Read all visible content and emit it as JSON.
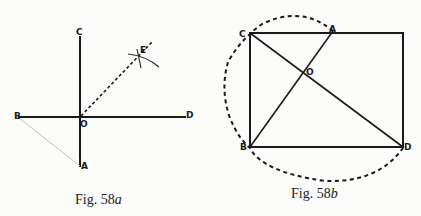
{
  "figures": [
    {
      "id": "58a",
      "caption": "Fig. 58a",
      "caption_prefix": "Fig. 58",
      "caption_suffix": "a",
      "points": {
        "C": "C",
        "E": "E",
        "B": "B",
        "O": "O",
        "D": "D",
        "A": "A"
      }
    },
    {
      "id": "58b",
      "caption": "Fig. 58b",
      "caption_prefix": "Fig. 58",
      "caption_suffix": "b",
      "points": {
        "C": "C",
        "A": "A",
        "O": "O",
        "B": "B",
        "D": "D"
      }
    }
  ],
  "colors": {
    "ink": "#1a1a1a",
    "paper": "#fbfbf9",
    "faint": "#bdbdbd"
  }
}
